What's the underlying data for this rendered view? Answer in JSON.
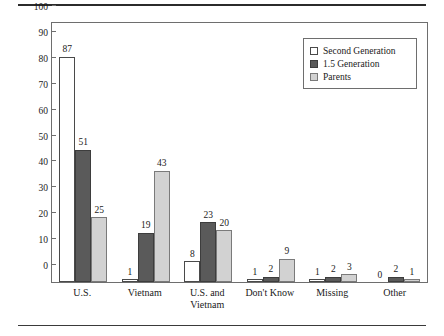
{
  "chart_data": {
    "type": "bar",
    "title": "",
    "xlabel": "",
    "ylabel": "Percentage",
    "ylim": [
      0,
      100
    ],
    "yticks": [
      0,
      10,
      20,
      30,
      40,
      50,
      60,
      70,
      80,
      90,
      100
    ],
    "grid": false,
    "legend_position": "top-right",
    "categories": [
      "U.S.",
      "Vietnam",
      "U.S. and\nVietnam",
      "Don't Know",
      "Missing",
      "Other"
    ],
    "series": [
      {
        "name": "Second Generation",
        "color": "#ffffff",
        "values": [
          87,
          1,
          8,
          1,
          1,
          0
        ]
      },
      {
        "name": "1.5 Generation",
        "color": "#5a5a5a",
        "values": [
          51,
          19,
          23,
          2,
          2,
          2
        ]
      },
      {
        "name": "Parents",
        "color": "#d2d2d2",
        "values": [
          25,
          43,
          20,
          9,
          3,
          1
        ]
      }
    ]
  },
  "axis": {
    "y_title": "Percentage",
    "y_ticks": [
      "100",
      "90",
      "80",
      "70",
      "60",
      "50",
      "40",
      "30",
      "20",
      "10",
      "0"
    ],
    "x_categories": [
      {
        "line1": "U.S.",
        "line2": ""
      },
      {
        "line1": "Vietnam",
        "line2": ""
      },
      {
        "line1": "U.S. and",
        "line2": "Vietnam"
      },
      {
        "line1": "Don't Know",
        "line2": ""
      },
      {
        "line1": "Missing",
        "line2": ""
      },
      {
        "line1": "Other",
        "line2": ""
      }
    ]
  },
  "legend": {
    "items": [
      {
        "label": "Second Generation",
        "series": 0
      },
      {
        "label": "1.5 Generation",
        "series": 1
      },
      {
        "label": "Parents",
        "series": 2
      }
    ]
  },
  "value_labels": {
    "g0": [
      "87",
      "51",
      "25"
    ],
    "g1": [
      "1",
      "19",
      "43"
    ],
    "g2": [
      "8",
      "23",
      "20"
    ],
    "g3": [
      "1",
      "2",
      "9"
    ],
    "g4": [
      "1",
      "2",
      "3"
    ],
    "g5": [
      "0",
      "2",
      "1"
    ]
  }
}
